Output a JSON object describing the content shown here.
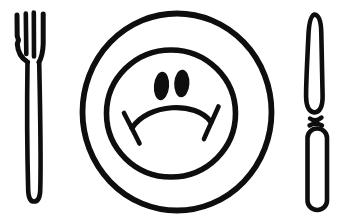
{
  "colors": {
    "ink": "#0e0e0e",
    "background": "#ffffff"
  },
  "scene": {
    "objects": [
      "fork-icon",
      "plate-icon",
      "sad-face-icon",
      "knife-icon"
    ],
    "face_expression": "frown"
  }
}
